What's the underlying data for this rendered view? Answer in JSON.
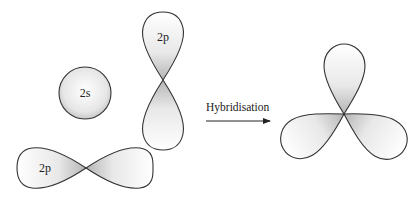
{
  "diagram": {
    "type": "orbital-hybridisation",
    "orbitals": {
      "s": {
        "label": "2s"
      },
      "p_vertical": {
        "label": "2p"
      },
      "p_horizontal": {
        "label": "2p"
      }
    },
    "arrow": {
      "label": "Hybridisation"
    },
    "result": {
      "label": ""
    },
    "colors": {
      "stroke": "#333333",
      "fill_light": "#ffffff",
      "fill_dark": "#bdbdbd"
    }
  }
}
